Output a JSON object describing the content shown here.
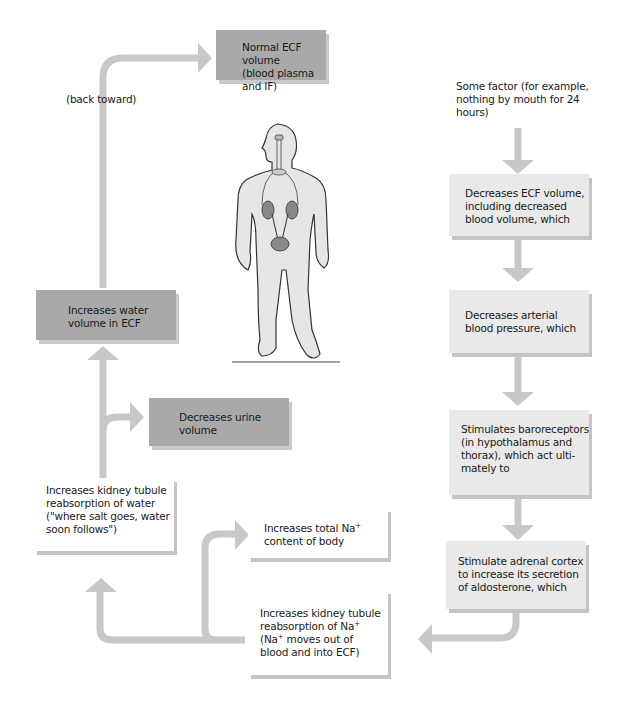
{
  "diagram": {
    "type": "feedback-loop flowchart",
    "colors": {
      "arrow": "#c8c8c8",
      "dark_box": "#a9a9a9",
      "light_box": "#e9e9e9",
      "white_box": "#ffffff",
      "shadow": "#c4c4c4"
    },
    "nodes": {
      "normal_ecf": {
        "line1": "Normal ECF volume",
        "line2": "(blood plasma and IF)"
      },
      "back_toward": "(back toward)",
      "some_factor": {
        "line1": "Some factor (for example,",
        "line2": "nothing by mouth for 24",
        "line3": "hours)"
      },
      "decreases_ecf": {
        "line1": "Decreases ECF volume,",
        "line2": "including decreased",
        "line3": "blood volume, which"
      },
      "decreases_bp": {
        "line1": "Decreases arterial",
        "line2": "blood pressure, which"
      },
      "baroreceptors": {
        "line1": "Stimulates baroreceptors",
        "line2": "(in hypothalamus and",
        "line3": "thorax), which act ulti-",
        "line4": "mately to"
      },
      "adrenal": {
        "line1": "Stimulate adrenal cortex",
        "line2": "to increase its secretion",
        "line3": "of aldosterone, which"
      },
      "na_reabsorption": {
        "line1": "Increases kidney tubule",
        "line2": "reabsorption of Na",
        "line2_sup": "+",
        "line3a": "(Na",
        "line3_sup": "+",
        "line3b": " moves out of",
        "line4": "blood and into ECF)"
      },
      "total_na": {
        "line1a": "Increases total Na",
        "line1_sup": "+",
        "line2": "content of body"
      },
      "water_reabsorption": {
        "line1": "Increases kidney tubule",
        "line2": "reabsorption of water",
        "line3": "(\"where salt goes, water",
        "line4": "soon follows\")"
      },
      "urine": {
        "line1": "Decreases urine",
        "line2": "volume"
      },
      "water_volume": {
        "line1": "Increases water",
        "line2": "volume in ECF"
      }
    },
    "illustration": "human-body-with-kidneys-and-bladder"
  }
}
